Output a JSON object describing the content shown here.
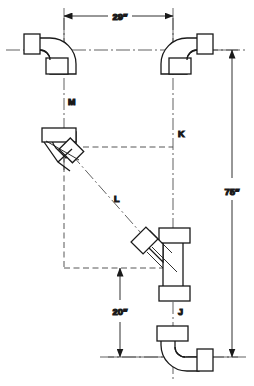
{
  "drawing": {
    "title": "Pipe fitting offset layout",
    "stroke_color": "#1a1a1a",
    "construction_color": "#555555",
    "background": "#ffffff"
  },
  "dimensions": [
    {
      "id": "width-29",
      "label": "29″",
      "orientation": "horizontal",
      "position": "top"
    },
    {
      "id": "height-75",
      "label": "75″",
      "orientation": "vertical",
      "position": "right"
    },
    {
      "id": "height-20",
      "label": "20″",
      "orientation": "vertical",
      "position": "bottom-center"
    }
  ],
  "callouts": [
    {
      "id": "M",
      "label": "M",
      "desc": "left vertical center line"
    },
    {
      "id": "K",
      "label": "K",
      "desc": "right vertical center line"
    },
    {
      "id": "L",
      "label": "L",
      "desc": "diagonal travel between 45 deg fittings"
    },
    {
      "id": "J",
      "label": "J",
      "desc": "wye fitting outlet"
    }
  ],
  "fittings": [
    {
      "id": "elbow-top-left",
      "type": "90-degree-elbow",
      "note": "horizontal inlet left, vertical outlet down"
    },
    {
      "id": "elbow-top-right",
      "type": "90-degree-elbow",
      "note": "horizontal inlet right, vertical outlet down"
    },
    {
      "id": "elbow-45-left",
      "type": "45-degree-elbow",
      "note": "vertical hub top, 45 deg outlet down-right"
    },
    {
      "id": "wye-fitting",
      "type": "wye-45-degree",
      "note": "vertical run with 45 deg branch up-left"
    },
    {
      "id": "elbow-bottom-right",
      "type": "90-degree-elbow",
      "note": "vertical inlet top, horizontal outlet right"
    }
  ]
}
